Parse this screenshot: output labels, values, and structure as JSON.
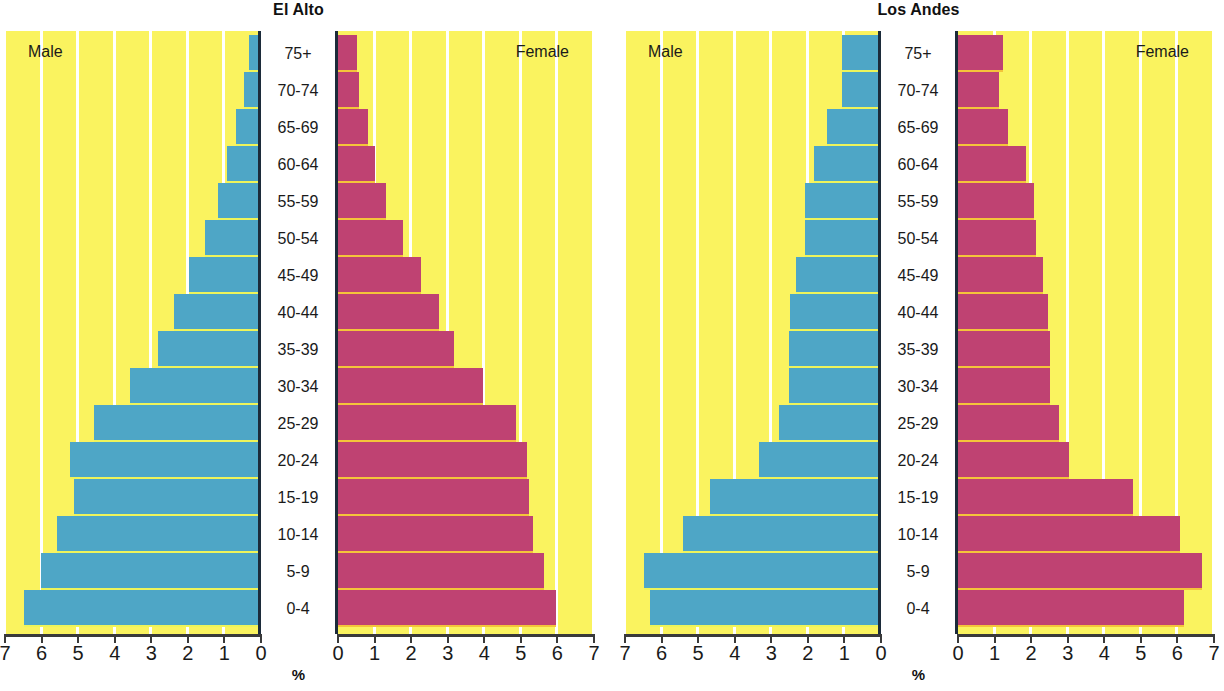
{
  "axis": {
    "unit_label": "%",
    "male_ticks": [
      "7",
      "6",
      "5",
      "4",
      "3",
      "2",
      "1",
      "0"
    ],
    "female_ticks": [
      "0",
      "1",
      "2",
      "3",
      "4",
      "5",
      "6",
      "7"
    ],
    "min": 0,
    "max": 7
  },
  "legend": {
    "male": "Male",
    "female": "Female"
  },
  "colors": {
    "male_bar": "#4ea6c6",
    "female_bar": "#bf4272",
    "plot_background": "#faf35f",
    "gridline": "#ffffff",
    "axis_line": "#1c2b3a",
    "label_column": "#ffffff"
  },
  "age_groups": [
    "75+",
    "70-74",
    "65-69",
    "60-64",
    "55-59",
    "50-54",
    "45-49",
    "40-44",
    "35-39",
    "30-34",
    "25-29",
    "20-24",
    "15-19",
    "10-14",
    "5-9",
    "0-4"
  ],
  "chart_data": [
    {
      "type": "bar",
      "title": "El Alto",
      "subtitle": "",
      "xlabel": "%",
      "ylabel": "",
      "xlim": [
        0,
        7
      ],
      "grid": true,
      "legend_position": "inside-top-corners",
      "categories": [
        "75+",
        "70-74",
        "65-69",
        "60-64",
        "55-59",
        "50-54",
        "45-49",
        "40-44",
        "35-39",
        "30-34",
        "25-29",
        "20-24",
        "15-19",
        "10-14",
        "5-9",
        "0-4"
      ],
      "series": [
        {
          "name": "Male",
          "side": "left",
          "values": [
            0.3,
            0.45,
            0.65,
            0.9,
            1.15,
            1.5,
            1.95,
            2.35,
            2.8,
            3.55,
            4.55,
            5.2,
            5.1,
            5.55,
            6.0,
            6.45
          ]
        },
        {
          "name": "Female",
          "side": "right",
          "values": [
            0.55,
            0.6,
            0.85,
            1.05,
            1.35,
            1.8,
            2.3,
            2.8,
            3.2,
            4.0,
            4.9,
            5.2,
            5.25,
            5.35,
            5.65,
            6.0
          ]
        }
      ]
    },
    {
      "type": "bar",
      "title": "Los Andes",
      "subtitle": "",
      "xlabel": "%",
      "ylabel": "",
      "xlim": [
        0,
        7
      ],
      "grid": true,
      "legend_position": "inside-top-corners",
      "categories": [
        "75+",
        "70-74",
        "65-69",
        "60-64",
        "55-59",
        "50-54",
        "45-49",
        "40-44",
        "35-39",
        "30-34",
        "25-29",
        "20-24",
        "15-19",
        "10-14",
        "5-9",
        "0-4"
      ],
      "series": [
        {
          "name": "Male",
          "side": "left",
          "values": [
            1.05,
            1.05,
            1.45,
            1.8,
            2.05,
            2.05,
            2.3,
            2.45,
            2.5,
            2.5,
            2.75,
            3.3,
            4.65,
            5.4,
            6.45,
            6.3
          ]
        },
        {
          "name": "Female",
          "side": "right",
          "values": [
            1.25,
            1.15,
            1.4,
            1.9,
            2.1,
            2.15,
            2.35,
            2.5,
            2.55,
            2.55,
            2.8,
            3.05,
            4.8,
            6.1,
            6.7,
            6.2
          ]
        }
      ]
    }
  ]
}
